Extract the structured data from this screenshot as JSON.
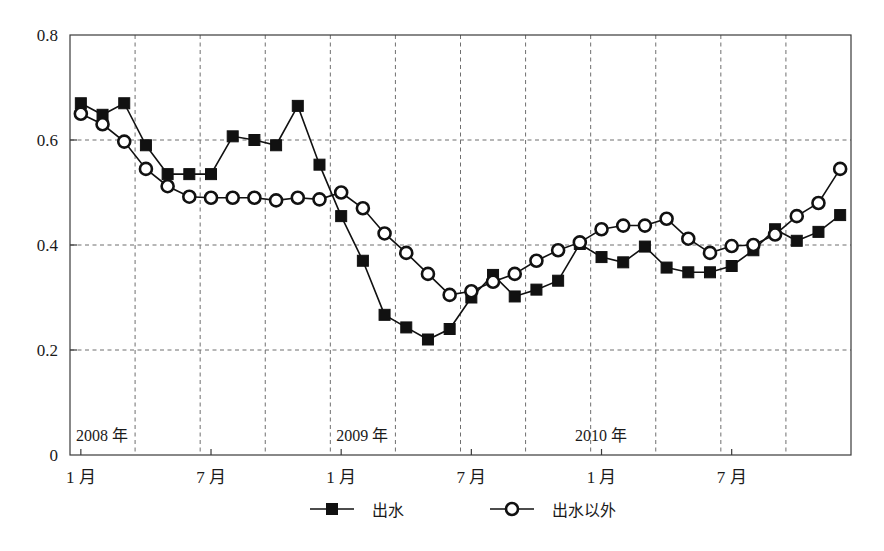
{
  "chart_data": {
    "type": "line",
    "title": "",
    "subtitle": "",
    "xlabel": "",
    "ylabel": "",
    "ylim": [
      0,
      0.8
    ],
    "yticks": [
      0,
      0.2,
      0.4,
      0.6,
      0.8
    ],
    "ytick_labels": [
      "0",
      "0.2",
      "0.4",
      "0.6",
      "0.8"
    ],
    "grid": true,
    "grid_style": "dashed",
    "legend_position": "bottom-center",
    "x": [
      "2008-01",
      "2008-02",
      "2008-03",
      "2008-04",
      "2008-05",
      "2008-06",
      "2008-07",
      "2008-08",
      "2008-09",
      "2008-10",
      "2008-11",
      "2008-12",
      "2009-01",
      "2009-02",
      "2009-03",
      "2009-04",
      "2009-05",
      "2009-06",
      "2009-07",
      "2009-08",
      "2009-09",
      "2009-10",
      "2009-11",
      "2009-12",
      "2010-01",
      "2010-02",
      "2010-03",
      "2010-04",
      "2010-05",
      "2010-06",
      "2010-07",
      "2010-08",
      "2010-09",
      "2010-10",
      "2010-11",
      "2010-12"
    ],
    "xtick_positions": [
      "2008-01",
      "2008-07",
      "2009-01",
      "2009-07",
      "2010-01",
      "2010-07"
    ],
    "xtick_labels": [
      "1 月",
      "7 月",
      "1 月",
      "7 月",
      "1 月",
      "7 月"
    ],
    "year_annotations": [
      {
        "label": "2008 年",
        "at": "2008-01"
      },
      {
        "label": "2009 年",
        "at": "2009-01"
      },
      {
        "label": "2010 年",
        "at": "2009-12"
      }
    ],
    "series": [
      {
        "name": "出水",
        "marker": "filled-square",
        "values": [
          0.67,
          0.648,
          0.67,
          0.59,
          0.535,
          0.535,
          0.535,
          0.607,
          0.6,
          0.59,
          0.665,
          0.553,
          0.455,
          0.37,
          0.267,
          0.243,
          0.22,
          0.24,
          0.3,
          0.343,
          0.302,
          0.315,
          0.332,
          0.402,
          0.377,
          0.367,
          0.397,
          0.357,
          0.348,
          0.348,
          0.36,
          0.39,
          0.43,
          0.408,
          0.425,
          0.457
        ]
      },
      {
        "name": "出水以外",
        "marker": "open-circle",
        "values": [
          0.65,
          0.63,
          0.597,
          0.545,
          0.512,
          0.492,
          0.49,
          0.49,
          0.49,
          0.485,
          0.49,
          0.487,
          0.5,
          0.47,
          0.422,
          0.385,
          0.345,
          0.305,
          0.312,
          0.33,
          0.345,
          0.37,
          0.39,
          0.405,
          0.43,
          0.437,
          0.437,
          0.45,
          0.412,
          0.385,
          0.398,
          0.4,
          0.42,
          0.455,
          0.48,
          0.545
        ]
      }
    ]
  },
  "legend": {
    "entries": [
      {
        "label": "出水",
        "marker": "filled-square"
      },
      {
        "label": "出水以外",
        "marker": "open-circle"
      }
    ]
  },
  "colors": {
    "series": "#111111",
    "grid": "#6f6f6f",
    "axis": "#3a3a3a",
    "background": "#ffffff"
  }
}
